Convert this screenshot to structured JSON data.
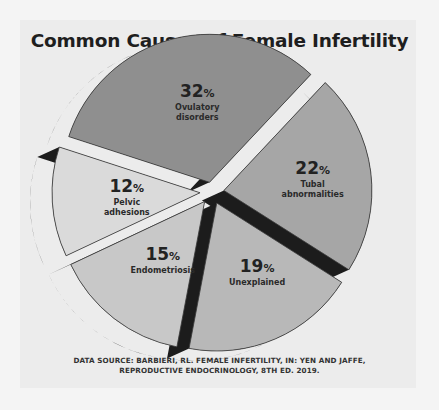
{
  "chart_data": {
    "type": "pie",
    "title": "Common Causes of Female Infertility",
    "slices": [
      {
        "label": "Ovulatory disorders",
        "label_lines": [
          "Ovulatory",
          "disorders"
        ],
        "value": 32,
        "display": "32",
        "color": "#8f8f8f"
      },
      {
        "label": "Tubal abnormalities",
        "label_lines": [
          "Tubal",
          "abnormalities"
        ],
        "value": 22,
        "display": "22",
        "color": "#a6a6a6"
      },
      {
        "label": "Unexplained",
        "label_lines": [
          "Unexplained"
        ],
        "value": 19,
        "display": "19",
        "color": "#b8b8b8"
      },
      {
        "label": "Endometriosis",
        "label_lines": [
          "Endometriosis"
        ],
        "value": 15,
        "display": "15",
        "color": "#c8c8c8"
      },
      {
        "label": "Pelvic adhesions",
        "label_lines": [
          "Pelvic",
          "adhesions"
        ],
        "value": 12,
        "display": "12",
        "color": "#dadada"
      }
    ],
    "unit": "%",
    "side_color": "#1c1c1c",
    "exploded": true,
    "source_lines": [
      "DATA SOURCE: BARBIERI, RL. FEMALE INFERTILITY, IN: YEN AND JAFFE,",
      "REPRODUCTIVE ENDOCRINOLOGY, 8TH ED. 2019."
    ]
  }
}
